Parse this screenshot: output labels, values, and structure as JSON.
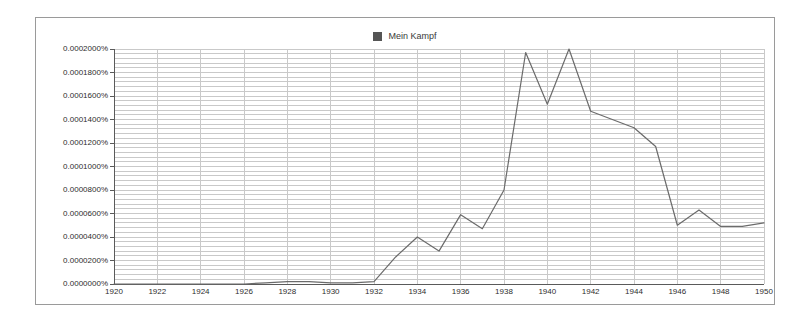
{
  "legend": {
    "entries": [
      {
        "label": "Mein Kampf",
        "color": "#555555",
        "swatch_name": "legend-swatch"
      }
    ]
  },
  "axes": {
    "y_tick_labels": [
      "0.0002000%",
      "0.0001800%",
      "0.0001600%",
      "0.0001400%",
      "0.0001200%",
      "0.0001000%",
      "0.0000800%",
      "0.0000600%",
      "0.0000400%",
      "0.0000200%",
      "0.0000000%"
    ],
    "x_tick_labels": [
      "1920",
      "1922",
      "1924",
      "1926",
      "1928",
      "1930",
      "1932",
      "1934",
      "1936",
      "1938",
      "1940",
      "1942",
      "1944",
      "1946",
      "1948",
      "1950"
    ]
  },
  "chart_data": {
    "type": "line",
    "title": "",
    "subtitle": "",
    "xlabel": "",
    "ylabel": "",
    "xlim": [
      1920,
      1950
    ],
    "ylim": [
      0,
      0.0002
    ],
    "grid": true,
    "legend_position": "top-center",
    "y_tick_step": 2e-06,
    "y_gridline_step": 4e-06,
    "x_tick_step": 2,
    "x": [
      1920,
      1921,
      1922,
      1923,
      1924,
      1925,
      1926,
      1927,
      1928,
      1929,
      1930,
      1931,
      1932,
      1933,
      1934,
      1935,
      1936,
      1937,
      1938,
      1939,
      1940,
      1941,
      1942,
      1943,
      1944,
      1945,
      1946,
      1947,
      1948,
      1949,
      1950
    ],
    "series": [
      {
        "name": "Mein Kampf",
        "color": "#6b6b6b",
        "values": [
          0.0,
          0.0,
          0.0,
          0.0,
          0.0,
          0.0,
          0.0,
          1e-06,
          2e-06,
          2e-06,
          1e-06,
          1e-06,
          2e-06,
          2.3e-05,
          4e-05,
          2.8e-05,
          5.9e-05,
          4.7e-05,
          8e-05,
          0.000197,
          0.000153,
          0.0002,
          0.000147,
          0.00014,
          0.000133,
          0.000117,
          5e-05,
          6.3e-05,
          4.9e-05,
          4.9e-05,
          5.2e-05
        ]
      }
    ]
  }
}
